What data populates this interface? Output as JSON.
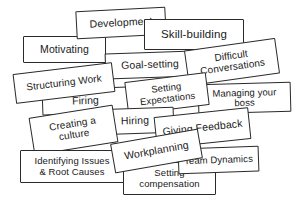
{
  "image": {
    "title": "Hand-drawn overlapping label cards of management topics",
    "background_color": "#ffffff",
    "card_fill_color": "#ffffff",
    "card_border_color": "#2a2a2a",
    "text_color": "#1a1a1a",
    "width": 296,
    "height": 201
  },
  "cards": [
    {
      "id": "development",
      "label": "Development",
      "x": 76,
      "y": 9,
      "w": 90,
      "h": 28,
      "rot": -3.0,
      "font": 10.5,
      "z": 6
    },
    {
      "id": "motivating",
      "label": "Motivating",
      "x": 23,
      "y": 36,
      "w": 83,
      "h": 27,
      "rot": 0.0,
      "font": 10.5,
      "z": 5
    },
    {
      "id": "skill-building",
      "label": "Skill-building",
      "x": 144,
      "y": 19,
      "w": 100,
      "h": 31,
      "rot": 0.0,
      "font": 11.5,
      "z": 7
    },
    {
      "id": "goal-setting",
      "label": "Goal-setting",
      "x": 105,
      "y": 52,
      "w": 90,
      "h": 26,
      "rot": -2.0,
      "font": 10.5,
      "z": 8
    },
    {
      "id": "difficult-conversations",
      "label": "Difficult\nConversations",
      "x": 186,
      "y": 44,
      "w": 92,
      "h": 36,
      "rot": -8.0,
      "font": 10.0,
      "z": 9
    },
    {
      "id": "structuring-work",
      "label": "Structuring Work",
      "x": 14,
      "y": 68,
      "w": 100,
      "h": 30,
      "rot": -7.0,
      "font": 10.0,
      "z": 10
    },
    {
      "id": "setting-expectations",
      "label": "Setting\nExpectations",
      "x": 126,
      "y": 77,
      "w": 82,
      "h": 33,
      "rot": -7.0,
      "font": 9.5,
      "z": 11
    },
    {
      "id": "managing-your-boss",
      "label": "Managing your\nboss",
      "x": 198,
      "y": 83,
      "w": 93,
      "h": 30,
      "rot": -1.5,
      "font": 9.5,
      "z": 10
    },
    {
      "id": "firing",
      "label": "Firing",
      "x": 42,
      "y": 88,
      "w": 87,
      "h": 26,
      "rot": -2.0,
      "font": 10.5,
      "z": 9
    },
    {
      "id": "hiring",
      "label": "Hiring",
      "x": 96,
      "y": 108,
      "w": 78,
      "h": 26,
      "rot": -2.0,
      "font": 10.5,
      "z": 11
    },
    {
      "id": "creating-a-culture",
      "label": "Creating a\nculture",
      "x": 31,
      "y": 111,
      "w": 85,
      "h": 38,
      "rot": -9.0,
      "font": 10.0,
      "z": 12
    },
    {
      "id": "giving-feedback",
      "label": "Giving Feedback",
      "x": 155,
      "y": 112,
      "w": 95,
      "h": 32,
      "rot": -6.0,
      "font": 10.5,
      "z": 12
    },
    {
      "id": "workplanning",
      "label": "Workplanning",
      "x": 112,
      "y": 136,
      "w": 89,
      "h": 30,
      "rot": -10.0,
      "font": 10.5,
      "z": 14
    },
    {
      "id": "team-dynamics",
      "label": "Team Dynamics",
      "x": 178,
      "y": 147,
      "w": 81,
      "h": 26,
      "rot": -2.0,
      "font": 9.5,
      "z": 13
    },
    {
      "id": "identifying-issues",
      "label": "Identifying Issues\n& Root Causes",
      "x": 20,
      "y": 150,
      "w": 104,
      "h": 33,
      "rot": 0.0,
      "font": 9.5,
      "z": 13
    },
    {
      "id": "setting-compensation",
      "label": "Setting\ncompensation",
      "x": 123,
      "y": 162,
      "w": 93,
      "h": 33,
      "rot": 0.0,
      "font": 9.5,
      "z": 12
    }
  ]
}
